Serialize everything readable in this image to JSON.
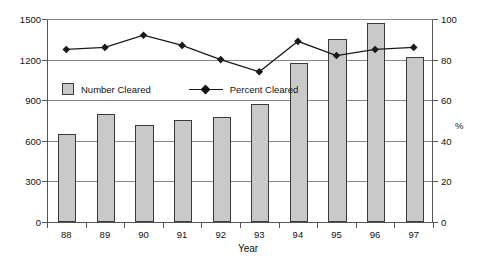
{
  "chart_data": {
    "type": "bar",
    "title": "",
    "xlabel": "Year",
    "ylabel": "",
    "y2label": "%",
    "categories": [
      "88",
      "89",
      "90",
      "91",
      "92",
      "93",
      "94",
      "95",
      "96",
      "97"
    ],
    "ylim": [
      0,
      1500
    ],
    "y2lim": [
      0,
      100
    ],
    "yticks": [
      "0",
      "300",
      "600",
      "900",
      "1200",
      "1500"
    ],
    "y2ticks": [
      "0",
      "20",
      "40",
      "60",
      "80",
      "100"
    ],
    "grid": true,
    "legend_position": "inside-upper-left",
    "series": [
      {
        "name": "Number Cleared",
        "type": "bar",
        "axis": "left",
        "color": "#c9c9c9",
        "edge_color": "#3a3a3a",
        "values": [
          650,
          795,
          715,
          755,
          775,
          875,
          1175,
          1355,
          1470,
          1220
        ]
      },
      {
        "name": "Percent Cleared",
        "type": "line",
        "axis": "right",
        "color": "#1a1a1a",
        "marker": "diamond",
        "values": [
          85,
          86,
          92,
          87,
          80,
          74,
          89,
          82,
          85,
          86
        ]
      }
    ]
  },
  "legend": {
    "bar_label": "Number Cleared",
    "line_label": "Percent Cleared"
  }
}
